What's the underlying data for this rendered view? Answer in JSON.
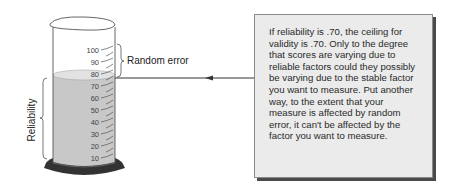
{
  "figure": {
    "cylinder": {
      "scale_labels": [
        "100",
        "90",
        "80",
        "70",
        "60",
        "50",
        "40",
        "30",
        "20",
        "10"
      ],
      "fill_level": 75,
      "liquid_color": "#c8c8c8",
      "base_color": "#333333"
    },
    "labels": {
      "random_error": "Random error",
      "reliability": "Reliability"
    },
    "callout": {
      "text": "If reliability is .70, the ceiling for validity is .70. Only to the degree that scores are varying due to reliable factors could they possibly be varying due to the stable factor you want to measure. Put another way, to the extent that your measure is affected by random error, it can't be affected by the factor you want to measure."
    }
  }
}
